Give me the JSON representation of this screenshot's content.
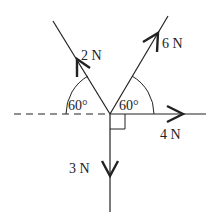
{
  "diagram": {
    "type": "force-diagram",
    "stroke_color": "#222222",
    "forces": [
      {
        "id": "f2",
        "label": "2 N",
        "direction": "up-left",
        "angle_from_horizontal_deg": 60
      },
      {
        "id": "f6",
        "label": "6 N",
        "direction": "up-right",
        "angle_from_horizontal_deg": 60
      },
      {
        "id": "f4",
        "label": "4 N",
        "direction": "right"
      },
      {
        "id": "f3",
        "label": "3 N",
        "direction": "down"
      }
    ],
    "angles": [
      {
        "id": "left-angle",
        "label": "60°"
      },
      {
        "id": "right-angle",
        "label": "60°"
      }
    ],
    "right_angle_marker": true,
    "reference_line": "dashed horizontal (left of origin)"
  }
}
